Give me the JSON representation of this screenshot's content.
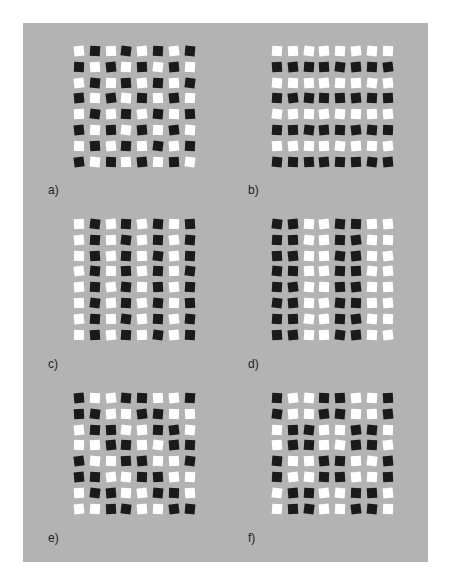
{
  "figure": {
    "background_color": "#b3b3b3",
    "dark_color": "#1a1a1a",
    "light_color": "#ffffff",
    "grid_size": 8,
    "panels": [
      {
        "label": "a)",
        "id": "a",
        "rows": [
          "WBWBWBWB",
          "BWBWBWBW",
          "WBWBWBWB",
          "BWBWBWBW",
          "WBWBWBWB",
          "BWBWBWBW",
          "WBWBWBWB",
          "BWBWBWBW"
        ]
      },
      {
        "label": "b)",
        "id": "b",
        "rows": [
          "WWWWWWWW",
          "BBBBBBBB",
          "WWWWWWWW",
          "BBBBBBBB",
          "WWWWWWWW",
          "BBBBBBBB",
          "WWWWWWWW",
          "BBBBBBBB"
        ]
      },
      {
        "label": "c)",
        "id": "c",
        "rows": [
          "WBWBWBWB",
          "WBWBWBWB",
          "WBWBWBWB",
          "WBWBWBWB",
          "WBWBWBWB",
          "WBWBWBWB",
          "WBWBWBWB",
          "WBWBWBWB"
        ]
      },
      {
        "label": "d)",
        "id": "d",
        "rows": [
          "BBWWBBWW",
          "BBWWBBWW",
          "BBWWBBWW",
          "BBWWBBWW",
          "BBWWBBWW",
          "BBWWBBWW",
          "BBWWBBWW",
          "BBWWBBWW"
        ]
      },
      {
        "label": "e)",
        "id": "e",
        "rows": [
          "BWWBBWWB",
          "BBWWBBWW",
          "WBBWWBBW",
          "WWBBWWBB",
          "BWWBBWWB",
          "BBWWBBWW",
          "WBBWWBBW",
          "WWBBWWBB"
        ]
      },
      {
        "label": "f)",
        "id": "f",
        "rows": [
          "BWWBBWWB",
          "BWWBBWWB",
          "WBBWWBBW",
          "WBBWWBBW",
          "BWWBBWWB",
          "BWWBBWWB",
          "WBBWWBBW",
          "WBBWWBBW"
        ]
      }
    ]
  }
}
